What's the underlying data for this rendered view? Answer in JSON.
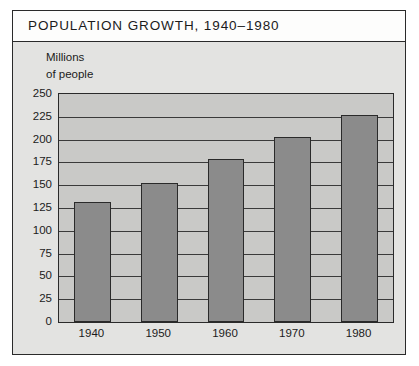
{
  "chart_data": {
    "type": "bar",
    "title": "POPULATION GROWTH, 1940–1980",
    "ylabel_line1": "Millions",
    "ylabel_line2": "of people",
    "xlabel": "",
    "categories": [
      "1940",
      "1950",
      "1960",
      "1970",
      "1980"
    ],
    "values": [
      132,
      152,
      179,
      203,
      227
    ],
    "ylim": [
      0,
      250
    ],
    "ytick_labels": [
      "250",
      "225",
      "200",
      "175",
      "150",
      "125",
      "100",
      "75",
      "50",
      "25",
      "0"
    ],
    "ytick_values": [
      250,
      225,
      200,
      175,
      150,
      125,
      100,
      75,
      50,
      25,
      0
    ],
    "ytick_step": 25,
    "grid": true,
    "legend": null,
    "colors": {
      "bar_fill": "#8b8b8b",
      "bar_edge": "#2a2a2a",
      "plot_background": "#c9c9c7",
      "figure_background": "#e3e3e1",
      "title_band_background": "#fdfdfc",
      "text": "#1b1b1b"
    }
  }
}
